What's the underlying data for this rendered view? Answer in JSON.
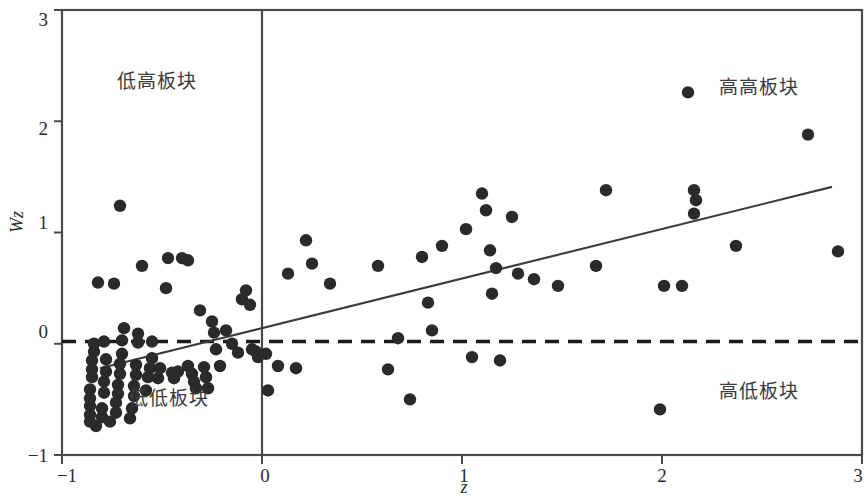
{
  "figure": {
    "background": "#ffffff",
    "point_color": "#2a2a2a",
    "axis_color": "#4a4a4a",
    "line_color": "#3b3b3b"
  },
  "axes": {
    "x_title": "z",
    "y_title": "Wz",
    "x_ticks": [
      {
        "value": -1,
        "label": "−1"
      },
      {
        "value": 0,
        "label": "0"
      },
      {
        "value": 1,
        "label": "1"
      },
      {
        "value": 2,
        "label": "2"
      },
      {
        "value": 3,
        "label": "3"
      }
    ],
    "y_ticks": [
      {
        "value": -1,
        "label": "−1"
      },
      {
        "value": 0,
        "label": "0"
      },
      {
        "value": 1,
        "label": "1"
      },
      {
        "value": 2,
        "label": "2"
      },
      {
        "value": 3,
        "label": "3"
      }
    ],
    "xlim": [
      -1,
      3
    ],
    "ylim": [
      -1,
      3
    ]
  },
  "quadrant_labels": {
    "low_high": "低高板块",
    "high_high": "高高板块",
    "low_low": "低低板块",
    "high_low": "高低板块"
  },
  "chart_data": {
    "type": "scatter",
    "title": "",
    "xlabel": "z",
    "ylabel": "Wz",
    "xlim": [
      -1,
      3
    ],
    "ylim": [
      -1,
      3
    ],
    "grid": false,
    "legend": null,
    "annotations": [
      {
        "text": "低高板块",
        "x": -0.73,
        "y": 2.44
      },
      {
        "text": "高高板块",
        "x": 2.3,
        "y": 2.37
      },
      {
        "text": "低低板块",
        "x": -0.66,
        "y": -0.54
      },
      {
        "text": "高低板块",
        "x": 2.3,
        "y": -0.48
      }
    ],
    "reference_lines": [
      {
        "kind": "vertical",
        "value": 0,
        "style": "solid",
        "color": "#4a4a4a"
      },
      {
        "kind": "horizontal",
        "value": 0.02,
        "style": "dashed",
        "color": "#1a1a1a"
      }
    ],
    "fit_line": {
      "style": "solid",
      "color": "#3b3b3b",
      "x_start": -0.81,
      "y_start": -0.22,
      "x_end": 2.85,
      "y_end": 1.41
    },
    "series": [
      {
        "name": "plates",
        "marker": "circle",
        "color": "#2a2a2a",
        "points": [
          [
            -0.86,
            -0.64
          ],
          [
            -0.86,
            -0.56
          ],
          [
            -0.86,
            -0.49
          ],
          [
            -0.86,
            -0.41
          ],
          [
            -0.85,
            -0.3
          ],
          [
            -0.85,
            -0.23
          ],
          [
            -0.85,
            -0.15
          ],
          [
            -0.84,
            -0.07
          ],
          [
            -0.84,
            0.0
          ],
          [
            -0.86,
            -0.7
          ],
          [
            -0.83,
            -0.74
          ],
          [
            -0.8,
            -0.66
          ],
          [
            -0.8,
            -0.58
          ],
          [
            -0.79,
            -0.44
          ],
          [
            -0.79,
            -0.34
          ],
          [
            -0.78,
            -0.25
          ],
          [
            -0.78,
            -0.14
          ],
          [
            -0.79,
            0.02
          ],
          [
            -0.82,
            0.55
          ],
          [
            -0.74,
            0.54
          ],
          [
            -0.76,
            -0.7
          ],
          [
            -0.73,
            -0.62
          ],
          [
            -0.73,
            -0.53
          ],
          [
            -0.72,
            -0.45
          ],
          [
            -0.72,
            -0.37
          ],
          [
            -0.71,
            -0.27
          ],
          [
            -0.71,
            -0.18
          ],
          [
            -0.7,
            -0.09
          ],
          [
            -0.7,
            0.03
          ],
          [
            -0.69,
            0.14
          ],
          [
            -0.71,
            1.24
          ],
          [
            -0.66,
            -0.67
          ],
          [
            -0.65,
            -0.58
          ],
          [
            -0.64,
            -0.47
          ],
          [
            -0.64,
            -0.38
          ],
          [
            -0.63,
            -0.28
          ],
          [
            -0.63,
            -0.19
          ],
          [
            -0.62,
            0.01
          ],
          [
            -0.62,
            0.09
          ],
          [
            -0.6,
            0.7
          ],
          [
            -0.58,
            -0.42
          ],
          [
            -0.57,
            -0.3
          ],
          [
            -0.56,
            -0.22
          ],
          [
            -0.55,
            -0.13
          ],
          [
            -0.55,
            0.02
          ],
          [
            -0.52,
            -0.31
          ],
          [
            -0.51,
            -0.22
          ],
          [
            -0.48,
            0.5
          ],
          [
            -0.47,
            0.77
          ],
          [
            -0.45,
            -0.26
          ],
          [
            -0.44,
            -0.31
          ],
          [
            -0.42,
            -0.25
          ],
          [
            -0.4,
            0.77
          ],
          [
            -0.37,
            0.75
          ],
          [
            -0.37,
            -0.2
          ],
          [
            -0.35,
            -0.27
          ],
          [
            -0.34,
            -0.34
          ],
          [
            -0.33,
            -0.4
          ],
          [
            -0.31,
            0.3
          ],
          [
            -0.29,
            -0.21
          ],
          [
            -0.28,
            -0.3
          ],
          [
            -0.27,
            -0.4
          ],
          [
            -0.25,
            0.2
          ],
          [
            -0.24,
            0.1
          ],
          [
            -0.23,
            -0.05
          ],
          [
            -0.21,
            -0.2
          ],
          [
            -0.18,
            0.12
          ],
          [
            -0.15,
            0.0
          ],
          [
            -0.12,
            -0.08
          ],
          [
            -0.1,
            0.4
          ],
          [
            -0.08,
            0.48
          ],
          [
            -0.06,
            0.35
          ],
          [
            -0.05,
            -0.05
          ],
          [
            -0.03,
            -0.07
          ],
          [
            -0.02,
            -0.12
          ],
          [
            0.02,
            -0.09
          ],
          [
            0.03,
            -0.42
          ],
          [
            0.08,
            -0.2
          ],
          [
            0.13,
            0.63
          ],
          [
            0.17,
            -0.22
          ],
          [
            0.22,
            0.93
          ],
          [
            0.25,
            0.72
          ],
          [
            0.34,
            0.54
          ],
          [
            0.58,
            0.7
          ],
          [
            0.63,
            -0.23
          ],
          [
            0.68,
            0.05
          ],
          [
            0.74,
            -0.5
          ],
          [
            0.8,
            0.78
          ],
          [
            0.83,
            0.37
          ],
          [
            0.85,
            0.12
          ],
          [
            0.9,
            0.88
          ],
          [
            1.02,
            1.03
          ],
          [
            1.05,
            -0.12
          ],
          [
            1.1,
            1.35
          ],
          [
            1.12,
            1.2
          ],
          [
            1.14,
            0.84
          ],
          [
            1.15,
            0.45
          ],
          [
            1.17,
            0.68
          ],
          [
            1.19,
            -0.15
          ],
          [
            1.25,
            1.14
          ],
          [
            1.28,
            0.63
          ],
          [
            1.36,
            0.58
          ],
          [
            1.48,
            0.52
          ],
          [
            1.67,
            0.7
          ],
          [
            1.72,
            1.38
          ],
          [
            1.99,
            -0.59
          ],
          [
            2.01,
            0.52
          ],
          [
            2.1,
            0.52
          ],
          [
            2.13,
            2.26
          ],
          [
            2.16,
            1.38
          ],
          [
            2.17,
            1.29
          ],
          [
            2.16,
            1.17
          ],
          [
            2.37,
            0.88
          ],
          [
            2.73,
            1.88
          ],
          [
            2.88,
            0.83
          ]
        ]
      }
    ]
  }
}
